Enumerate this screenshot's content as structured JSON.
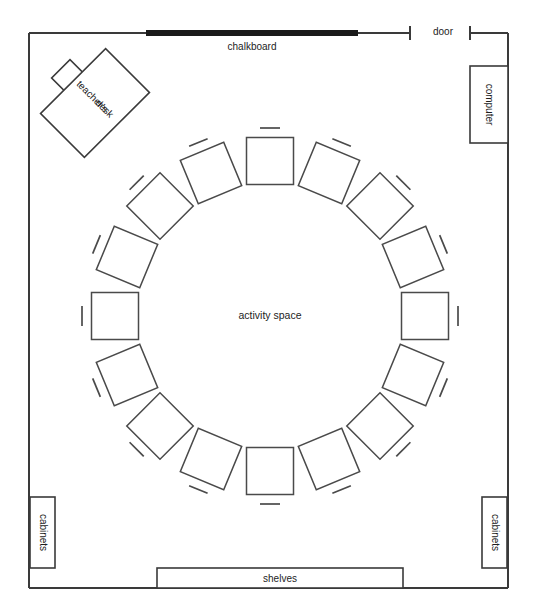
{
  "diagram": {
    "type": "classroom-floor-plan",
    "title": "",
    "canvas": {
      "width": 536,
      "height": 616
    },
    "room": {
      "x": 29,
      "y": 33,
      "width": 479,
      "height": 555
    },
    "colors": {
      "wall": "#3a3a3a",
      "furniture_stroke": "#3a3a3a",
      "desk_stroke": "#4a4a4a",
      "chalkboard_fill": "#1a1a1a",
      "background": "#ffffff",
      "text": "#1d1d1d"
    }
  },
  "labels": {
    "chalkboard": "chalkboard",
    "door": "door",
    "computer": "computer",
    "teachers_desk_line1": "teacher's",
    "teachers_desk_line2": "desk",
    "activity_space": "activity space",
    "cabinets_left": "cabinets",
    "cabinets_right": "cabinets",
    "shelves": "shelves"
  },
  "fixtures": {
    "chalkboard": {
      "x": 146,
      "y": 30,
      "width": 212,
      "height": 6
    },
    "door_gap": {
      "x_start": 410,
      "x_end": 470,
      "y": 33
    },
    "computer_desk": {
      "x": 470,
      "y": 66,
      "width": 38,
      "height": 77
    },
    "teachers_desk": {
      "cx": 95,
      "cy": 103,
      "width": 92,
      "height": 62,
      "rotation": -45
    },
    "teachers_chair": {
      "cx": 70,
      "cy": 78,
      "size": 26,
      "rotation": -45
    },
    "cabinet_left": {
      "x": 30,
      "y": 497,
      "width": 25,
      "height": 71
    },
    "cabinet_right": {
      "x": 482,
      "y": 497,
      "width": 25,
      "height": 71
    },
    "shelves": {
      "x": 157,
      "y": 568,
      "width": 246,
      "height": 20
    }
  },
  "chart_data": {
    "type": "scatter",
    "xlabel": "room width (px)",
    "ylabel": "room depth (px)",
    "xlim": [
      29,
      508
    ],
    "ylim": [
      33,
      588
    ],
    "grid": false,
    "legend": "none",
    "circle": {
      "center_x": 270,
      "center_y": 316,
      "radius": 155,
      "desk_count": 16
    },
    "desk_size": 47,
    "chair_offset": 33,
    "chair_length": 20,
    "categories": [
      "desk-1",
      "desk-2",
      "desk-3",
      "desk-4",
      "desk-5",
      "desk-6",
      "desk-7",
      "desk-8",
      "desk-9",
      "desk-10",
      "desk-11",
      "desk-12",
      "desk-13",
      "desk-14",
      "desk-15",
      "desk-16"
    ],
    "series": [
      {
        "name": "student desks",
        "points": [
          {
            "id": "desk-1",
            "angle_deg": -90,
            "x": 270,
            "y": 161
          },
          {
            "id": "desk-2",
            "angle_deg": -67.5,
            "x": 329,
            "y": 173
          },
          {
            "id": "desk-3",
            "angle_deg": -45,
            "x": 380,
            "y": 206
          },
          {
            "id": "desk-4",
            "angle_deg": -22.5,
            "x": 413,
            "y": 257
          },
          {
            "id": "desk-5",
            "angle_deg": 0,
            "x": 425,
            "y": 316
          },
          {
            "id": "desk-6",
            "angle_deg": 22.5,
            "x": 413,
            "y": 375
          },
          {
            "id": "desk-7",
            "angle_deg": 45,
            "x": 380,
            "y": 426
          },
          {
            "id": "desk-8",
            "angle_deg": 67.5,
            "x": 329,
            "y": 459
          },
          {
            "id": "desk-9",
            "angle_deg": 90,
            "x": 270,
            "y": 471
          },
          {
            "id": "desk-10",
            "angle_deg": 112.5,
            "x": 211,
            "y": 459
          },
          {
            "id": "desk-11",
            "angle_deg": 135,
            "x": 160,
            "y": 426
          },
          {
            "id": "desk-12",
            "angle_deg": 157.5,
            "x": 127,
            "y": 375
          },
          {
            "id": "desk-13",
            "angle_deg": 180,
            "x": 115,
            "y": 316
          },
          {
            "id": "desk-14",
            "angle_deg": 202.5,
            "x": 127,
            "y": 257
          },
          {
            "id": "desk-15",
            "angle_deg": 225,
            "x": 160,
            "y": 206
          },
          {
            "id": "desk-16",
            "angle_deg": 247.5,
            "x": 211,
            "y": 173
          }
        ]
      }
    ]
  }
}
